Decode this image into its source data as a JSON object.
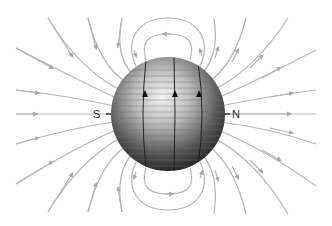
{
  "diagram": {
    "labels": {
      "south": "S",
      "north": "N"
    },
    "colors": {
      "field_line": "#b3b3b3",
      "axis_line": "#333333",
      "sphere_light": "#f2f2f2",
      "sphere_dark": "#1e1e1e",
      "background": "#ffffff"
    }
  }
}
